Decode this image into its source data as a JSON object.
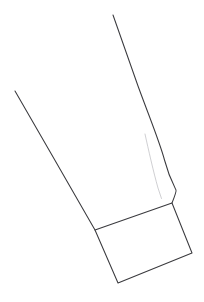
{
  "document": {
    "kind": "line-art-sketch",
    "subject": "sleeve-cuff-technical-drawing",
    "width": 204,
    "height": 302,
    "background_color": "#ffffff"
  },
  "palette": {
    "background": "#ffffff",
    "outline_stroke": "#3a3a3e",
    "accent_stroke": "#4a4a50",
    "light_stroke": "#c9c9cd"
  },
  "strokes": {
    "left_seam": {
      "name": "left-seam-line",
      "color": "#3a3a3e",
      "width": 1.05,
      "path": "M 15.0 91.0 L 54.5 159.5 L 95.0 230.0"
    },
    "right_seam": {
      "name": "right-seam-line",
      "color": "#3a3a3e",
      "width": 1.05,
      "path": "M 113.0 15.0 L 138.0 86.0 C 150.5 120.0 160.0 143.0 164.5 160.0 C 168.5 175.5 173.5 185.0 176.0 190.0 C 176.6 191.3 175.0 195.5 172.0 203.0"
    },
    "cuff_quad": {
      "name": "cuff-quadrilateral",
      "color": "#3a3a3e",
      "width": 1.05,
      "path": "M 95.0 230.0 L 172.0 203.0 L 192.0 253.0 L 118.0 283.0 Z"
    },
    "inner_fold": {
      "name": "inner-fold-line",
      "color": "#c9c9cd",
      "width": 0.9,
      "path": "M 145.0 134.0 C 148.5 150.0 153.5 172.0 158.0 188.0 L 161.5 198.5"
    }
  },
  "vertices": {
    "left_seam_top": {
      "x": 15,
      "y": 91
    },
    "right_seam_top": {
      "x": 113,
      "y": 15
    },
    "cuff_left": {
      "x": 95,
      "y": 230
    },
    "cuff_top_right": {
      "x": 172,
      "y": 203
    },
    "cuff_bottom_right": {
      "x": 192,
      "y": 253
    },
    "cuff_bottom_left": {
      "x": 118,
      "y": 283
    },
    "fold_top": {
      "x": 145,
      "y": 134
    },
    "fold_bottom": {
      "x": 161.5,
      "y": 198.5
    }
  }
}
